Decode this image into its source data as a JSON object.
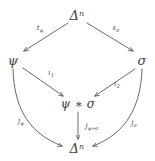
{
  "diagram": {
    "type": "commutative-diagram",
    "background_color": "#ffffff",
    "ink_color": "#4a4a4a",
    "nodes": [
      {
        "id": "top",
        "label_base": "Δ",
        "label_sup": "n",
        "label_full": "Δⁿ",
        "x": 77,
        "y": 15
      },
      {
        "id": "left",
        "label_base": "ψ",
        "label_sup": "",
        "label_full": "ψ",
        "x": 13,
        "y": 60
      },
      {
        "id": "right",
        "label_base": "σ",
        "label_sup": "",
        "label_full": "σ",
        "x": 142,
        "y": 60
      },
      {
        "id": "center",
        "label_base": "ψ ∗ σ",
        "label_sup": "",
        "label_full": "ψ ∗ σ",
        "x": 78,
        "y": 104
      },
      {
        "id": "bottom",
        "label_base": "Δ",
        "label_sup": "n",
        "label_full": "Δⁿ",
        "x": 77,
        "y": 148
      }
    ],
    "edges": [
      {
        "id": "top-to-left",
        "from": "top",
        "to": "left",
        "shape": "straight",
        "label_main": "t",
        "label_sub": "ψ",
        "label_x": 40,
        "label_y": 28
      },
      {
        "id": "top-to-right",
        "from": "top",
        "to": "right",
        "shape": "straight",
        "label_main": "s",
        "label_sub": "σ",
        "label_x": 116,
        "label_y": 28
      },
      {
        "id": "left-to-center",
        "from": "left",
        "to": "center",
        "shape": "straight",
        "label_main": "ι",
        "label_sub": "1",
        "label_x": 51,
        "label_y": 73
      },
      {
        "id": "right-to-center",
        "from": "right",
        "to": "center",
        "shape": "straight",
        "label_main": "ι",
        "label_sub": "2",
        "label_x": 117,
        "label_y": 84
      },
      {
        "id": "center-to-bottom",
        "from": "center",
        "to": "bottom",
        "shape": "straight",
        "label_main": "j",
        "label_sub": "ψ∗σ",
        "label_x": 92,
        "label_y": 126
      },
      {
        "id": "left-to-bottom",
        "from": "left",
        "to": "bottom",
        "shape": "curved",
        "label_main": "j",
        "label_sub": "ψ",
        "label_x": 21,
        "label_y": 121
      },
      {
        "id": "right-to-bottom",
        "from": "right",
        "to": "bottom",
        "shape": "curved",
        "label_main": "j",
        "label_sub": "σ",
        "label_x": 134,
        "label_y": 123
      }
    ]
  }
}
